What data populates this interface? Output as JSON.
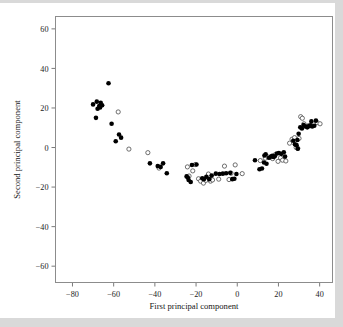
{
  "figure": {
    "name": "principal-component-scatter",
    "background": "#ffffff"
  },
  "chart_data": {
    "type": "scatter",
    "title": "",
    "xlabel": "First principal component",
    "ylabel": "Second principal component",
    "xlim": [
      -88,
      46
    ],
    "ylim": [
      -68,
      66
    ],
    "xticks": [
      -80,
      -60,
      -40,
      -20,
      0,
      20,
      40
    ],
    "xticklabels": [
      "−80",
      "−60",
      "−40",
      "−20",
      "0",
      "20",
      "40"
    ],
    "yticks": [
      -60,
      -40,
      -20,
      0,
      20,
      40,
      60
    ],
    "yticklabels": [
      "−60",
      "−40",
      "−20",
      "0",
      "20",
      "40",
      "60"
    ],
    "grid": false,
    "legend": null,
    "marker_radius_filled": 2.3,
    "marker_radius_open": 2.1,
    "colors": {
      "filled": "#000000",
      "open_fill": "#ffffff",
      "open_stroke": "#555555",
      "frame": "#8c8c8c",
      "text": "#1a1a1a"
    },
    "series": [
      {
        "name": "filled",
        "marker": "solid-circle",
        "points": [
          [
            -62.5,
            32.5
          ],
          [
            -70.0,
            21.8
          ],
          [
            -68.2,
            23.2
          ],
          [
            -67.0,
            21.0
          ],
          [
            -66.3,
            22.6
          ],
          [
            -65.6,
            21.4
          ],
          [
            -66.6,
            20.2
          ],
          [
            -67.8,
            19.6
          ],
          [
            -68.6,
            15.0
          ],
          [
            -61.0,
            12.0
          ],
          [
            -59.0,
            3.2
          ],
          [
            -57.4,
            6.6
          ],
          [
            -56.4,
            5.0
          ],
          [
            -42.4,
            -8.0
          ],
          [
            -38.6,
            -9.4
          ],
          [
            -37.2,
            -9.8
          ],
          [
            -36.0,
            -8.0
          ],
          [
            -34.2,
            -13.0
          ],
          [
            -24.6,
            -14.6
          ],
          [
            -24.0,
            -15.2
          ],
          [
            -23.6,
            -16.4
          ],
          [
            -22.6,
            -17.4
          ],
          [
            -22.0,
            -8.8
          ],
          [
            -19.8,
            -8.6
          ],
          [
            -17.0,
            -15.6
          ],
          [
            -16.2,
            -16.0
          ],
          [
            -15.0,
            -14.8
          ],
          [
            -13.6,
            -16.0
          ],
          [
            -12.4,
            -14.2
          ],
          [
            -10.4,
            -13.2
          ],
          [
            -8.6,
            -13.4
          ],
          [
            -7.0,
            -13.2
          ],
          [
            -5.4,
            -13.0
          ],
          [
            -3.4,
            -12.8
          ],
          [
            -2.4,
            -16.0
          ],
          [
            -1.4,
            -15.8
          ],
          [
            -0.4,
            -13.4
          ],
          [
            8.6,
            -6.4
          ],
          [
            10.8,
            -11.0
          ],
          [
            12.0,
            -10.6
          ],
          [
            13.2,
            -4.0
          ],
          [
            13.8,
            -3.4
          ],
          [
            13.0,
            -7.6
          ],
          [
            14.2,
            -8.2
          ],
          [
            15.4,
            -5.2
          ],
          [
            16.4,
            -4.6
          ],
          [
            17.0,
            -4.2
          ],
          [
            17.6,
            -4.8
          ],
          [
            18.2,
            -4.4
          ],
          [
            19.2,
            -3.0
          ],
          [
            20.2,
            -2.8
          ],
          [
            21.4,
            -3.2
          ],
          [
            22.6,
            -2.4
          ],
          [
            23.2,
            -4.6
          ],
          [
            27.2,
            3.4
          ],
          [
            28.0,
            1.6
          ],
          [
            28.8,
            1.2
          ],
          [
            29.2,
            3.8
          ],
          [
            29.8,
            7.0
          ],
          [
            30.6,
            10.2
          ],
          [
            31.4,
            9.6
          ],
          [
            32.2,
            11.4
          ],
          [
            33.2,
            10.6
          ],
          [
            34.0,
            10.2
          ],
          [
            34.8,
            10.8
          ],
          [
            35.6,
            11.2
          ],
          [
            36.4,
            10.6
          ],
          [
            36.0,
            13.2
          ],
          [
            37.4,
            11.0
          ],
          [
            38.2,
            13.6
          ],
          [
            29.4,
            -0.6
          ]
        ]
      },
      {
        "name": "open",
        "marker": "open-circle",
        "points": [
          [
            -57.8,
            18.0
          ],
          [
            -52.6,
            -0.8
          ],
          [
            -43.4,
            -2.6
          ],
          [
            -38.0,
            -10.4
          ],
          [
            -24.2,
            -9.8
          ],
          [
            -23.4,
            -14.4
          ],
          [
            -21.6,
            -11.8
          ],
          [
            -20.4,
            -8.6
          ],
          [
            -18.8,
            -15.8
          ],
          [
            -17.8,
            -17.0
          ],
          [
            -16.4,
            -18.0
          ],
          [
            -15.2,
            -16.6
          ],
          [
            -14.0,
            -13.4
          ],
          [
            -13.0,
            -17.0
          ],
          [
            -12.0,
            -16.4
          ],
          [
            -9.0,
            -16.0
          ],
          [
            -6.2,
            -9.4
          ],
          [
            -4.0,
            -16.2
          ],
          [
            -3.0,
            -13.0
          ],
          [
            -1.0,
            -8.8
          ],
          [
            2.4,
            -13.2
          ],
          [
            13.6,
            -5.4
          ],
          [
            15.0,
            -4.8
          ],
          [
            16.2,
            -5.0
          ],
          [
            17.2,
            -5.6
          ],
          [
            18.4,
            -3.6
          ],
          [
            19.8,
            -7.0
          ],
          [
            21.0,
            -5.2
          ],
          [
            22.0,
            -6.4
          ],
          [
            25.4,
            2.2
          ],
          [
            26.6,
            4.2
          ],
          [
            27.8,
            5.0
          ],
          [
            28.6,
            0.0
          ],
          [
            29.4,
            -0.4
          ],
          [
            30.0,
            4.6
          ],
          [
            30.8,
            15.6
          ],
          [
            31.6,
            14.8
          ],
          [
            32.4,
            12.0
          ],
          [
            34.4,
            11.0
          ],
          [
            38.8,
            12.6
          ],
          [
            40.2,
            12.0
          ],
          [
            23.6,
            -6.8
          ],
          [
            11.2,
            -6.6
          ]
        ]
      }
    ]
  }
}
